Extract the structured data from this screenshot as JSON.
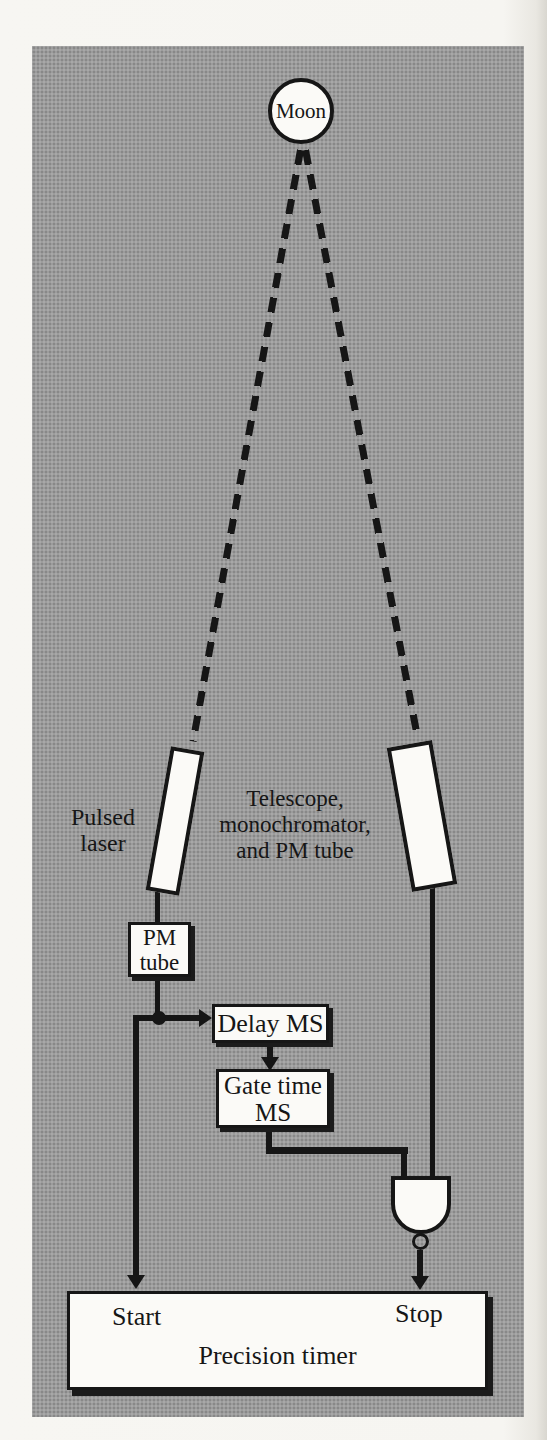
{
  "figure": {
    "moon_label": "Moon",
    "laser_label_lines": [
      "Pulsed",
      "laser"
    ],
    "telescope_label_lines": [
      "Telescope,",
      "monochromator,",
      "and PM tube"
    ],
    "pm_tube_lines": [
      "PM",
      "tube"
    ],
    "delay_label": "Delay MS",
    "gate_time_lines": [
      "Gate time",
      "MS"
    ],
    "timer": {
      "start_label": "Start",
      "stop_label": "Stop",
      "title": "Precision timer"
    }
  },
  "colors": {
    "panel_gray": "#9c9c9c",
    "box_fill": "#fbfaf7",
    "line_black": "#161616",
    "page_bg": "#f6f5f1"
  }
}
